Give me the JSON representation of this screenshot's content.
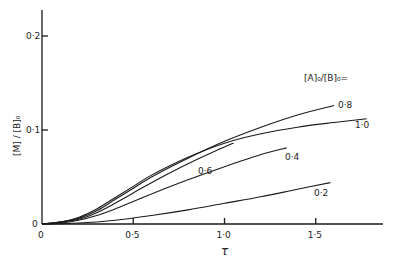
{
  "chart_data": {
    "type": "line",
    "title": "",
    "xlabel": "τ",
    "ylabel": "[M] / [B]₀",
    "xlim": [
      0,
      1.85
    ],
    "ylim": [
      0,
      0.23
    ],
    "grid": false,
    "x_ticks": [
      "0",
      "0·5",
      "1·0",
      "1·5"
    ],
    "y_ticks": [
      "0",
      "0·1",
      "0·2"
    ],
    "legend_title": "[A]₀/[B]₀=",
    "series": [
      {
        "name": "0·8",
        "x": [
          0,
          0.1,
          0.2,
          0.3,
          0.4,
          0.5,
          0.6,
          0.8,
          1.0,
          1.2,
          1.4,
          1.6
        ],
        "y": [
          0,
          0.002,
          0.006,
          0.014,
          0.026,
          0.038,
          0.05,
          0.07,
          0.088,
          0.103,
          0.116,
          0.126
        ]
      },
      {
        "name": "1·0",
        "x": [
          0,
          0.1,
          0.2,
          0.3,
          0.4,
          0.5,
          0.6,
          0.8,
          1.0,
          1.2,
          1.4,
          1.6,
          1.78
        ],
        "y": [
          0,
          0.002,
          0.007,
          0.016,
          0.028,
          0.04,
          0.052,
          0.071,
          0.086,
          0.096,
          0.103,
          0.108,
          0.112
        ]
      },
      {
        "name": "0·6",
        "x": [
          0,
          0.1,
          0.2,
          0.3,
          0.4,
          0.5,
          0.6,
          0.8,
          1.0,
          1.05
        ],
        "y": [
          0,
          0.002,
          0.005,
          0.012,
          0.022,
          0.033,
          0.044,
          0.064,
          0.082,
          0.086
        ]
      },
      {
        "name": "0·4",
        "x": [
          0,
          0.1,
          0.2,
          0.3,
          0.4,
          0.5,
          0.6,
          0.8,
          1.0,
          1.2,
          1.34
        ],
        "y": [
          0,
          0.001,
          0.004,
          0.009,
          0.016,
          0.024,
          0.032,
          0.047,
          0.061,
          0.074,
          0.081
        ]
      },
      {
        "name": "0·2",
        "x": [
          0,
          0.2,
          0.4,
          0.6,
          0.8,
          1.0,
          1.2,
          1.4,
          1.58
        ],
        "y": [
          0,
          0.001,
          0.004,
          0.009,
          0.015,
          0.022,
          0.029,
          0.037,
          0.044
        ]
      }
    ],
    "curve_labels": [
      {
        "text": "0·8",
        "x": 338,
        "y": 108
      },
      {
        "text": "1·0",
        "x": 355,
        "y": 128
      },
      {
        "text": "0·6",
        "x": 198,
        "y": 174
      },
      {
        "text": "0·4",
        "x": 285,
        "y": 160
      },
      {
        "text": "0·2",
        "x": 314,
        "y": 196
      }
    ]
  },
  "axes": {
    "x_label": "τ",
    "y_label": "[M] / [B]₀",
    "legend_title": "[A]₀/[B]₀="
  }
}
